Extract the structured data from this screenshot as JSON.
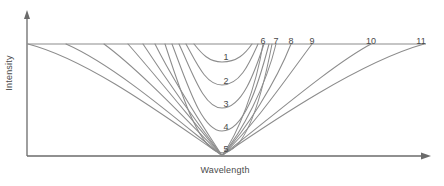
{
  "figure": {
    "type": "line-plot",
    "background": "#ffffff",
    "curve_color": "#8c8c8c",
    "axis_color": "#6b6b6b",
    "text_color": "#4a4a4a"
  },
  "axes": {
    "ylabel": "Intensity",
    "xlabel": "Wavelength",
    "y_arrow": "up-arrow-icon",
    "x_arrow": "right-arrow-icon",
    "origin": {
      "x": 27,
      "y": 156
    },
    "top_line_y": 44,
    "top_line_x_start": 27,
    "top_line_x_end": 426
  },
  "chart_data": {
    "type": "line",
    "title": "",
    "xlabel": "Wavelength",
    "ylabel": "Intensity",
    "grid": false,
    "legend": "inline-curve-labels",
    "xlim": [
      27,
      426
    ],
    "ylim": [
      44,
      156
    ],
    "convergence_point": {
      "x": 222,
      "y": 156
    },
    "curves": [
      {
        "label": "1",
        "label_x": 226,
        "label_y": 52,
        "left_top_x": 194,
        "right_top_x": 252,
        "min_y": 62,
        "label_position": "inside"
      },
      {
        "label": "2",
        "label_x": 226,
        "label_y": 76,
        "left_top_x": 186,
        "right_top_x": 258,
        "min_y": 85,
        "label_position": "inside"
      },
      {
        "label": "3",
        "label_x": 226,
        "label_y": 99,
        "left_top_x": 179,
        "right_top_x": 264,
        "min_y": 108,
        "label_position": "inside"
      },
      {
        "label": "4",
        "label_x": 226,
        "label_y": 122,
        "left_top_x": 172,
        "right_top_x": 269,
        "min_y": 131,
        "label_position": "inside"
      },
      {
        "label": "5",
        "label_x": 226,
        "label_y": 144,
        "left_top_x": 165,
        "right_top_x": 272,
        "min_y": 153,
        "label_position": "inside"
      },
      {
        "label": "6",
        "label_x": 263,
        "label_y": 36,
        "left_top_x": 155,
        "right_top_x": 263,
        "min_y": 156,
        "label_position": "top"
      },
      {
        "label": "7",
        "label_x": 276,
        "label_y": 36,
        "left_top_x": 143,
        "right_top_x": 276,
        "min_y": 156,
        "label_position": "top"
      },
      {
        "label": "8",
        "label_x": 291,
        "label_y": 36,
        "left_top_x": 128,
        "right_top_x": 291,
        "min_y": 156,
        "label_position": "top"
      },
      {
        "label": "9",
        "label_x": 312,
        "label_y": 36,
        "left_top_x": 104,
        "right_top_x": 312,
        "min_y": 156,
        "label_position": "top"
      },
      {
        "label": "10",
        "label_x": 371,
        "label_y": 36,
        "left_top_x": 66,
        "right_top_x": 371,
        "min_y": 156,
        "label_position": "top"
      },
      {
        "label": "11",
        "label_x": 421,
        "label_y": 36,
        "left_top_x": 28,
        "right_top_x": 424,
        "min_y": 156,
        "label_position": "top"
      }
    ]
  }
}
